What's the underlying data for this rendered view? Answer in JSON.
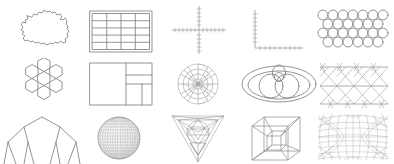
{
  "canvas": {
    "width": 394,
    "height": 164,
    "background": "#ffffff",
    "stroke_color": "#7a7a7a",
    "faint_stroke_color": "#a8a8a8"
  },
  "grid": {
    "columns": 5,
    "rows": 3,
    "cell_width": 79,
    "cell_height": 55
  },
  "figures": [
    {
      "id": "irregular-blob-contour",
      "name": "Irregular closed contour",
      "row": 1,
      "col": 1,
      "type": "outline",
      "description": "Jagged irregular closed polygon resembling a map region or amoeba outline",
      "x": 18,
      "y": 10,
      "w": 48,
      "h": 38
    },
    {
      "id": "rectangular-grid-table",
      "name": "Rectangular grid table",
      "row": 1,
      "col": 2,
      "type": "grid",
      "description": "Outer rectangle with inner 4 column by 5 row cell grid",
      "columns": 4,
      "rows": 5,
      "x": 91,
      "y": 12,
      "w": 60,
      "h": 40
    },
    {
      "id": "cross-axes-with-ticks",
      "name": "Cross axes with tick marks",
      "row": 1,
      "col": 3,
      "type": "axes",
      "description": "Horizontal and vertical axis crossing at origin, dashed tick marks along both",
      "tick_count_horizontal": 18,
      "tick_count_vertical": 14,
      "x": 172,
      "y": 8,
      "w": 52,
      "h": 46
    },
    {
      "id": "l-shaped-axes",
      "name": "L-shaped plot axes",
      "row": 1,
      "col": 4,
      "type": "axes",
      "description": "Left vertical axis and bottom horizontal axis forming an L with tick marks",
      "tick_count_horizontal": 10,
      "tick_count_vertical": 9,
      "x": 252,
      "y": 10,
      "w": 48,
      "h": 40
    },
    {
      "id": "hexagonal-circle-packing",
      "name": "Hexagonal circle packing",
      "row": 1,
      "col": 5,
      "type": "packing",
      "description": "Four offset rows of tangent circles in hexagonal close packing",
      "rows": 4,
      "circles_per_row": 6,
      "x": 318,
      "y": 10,
      "w": 72,
      "h": 40
    },
    {
      "id": "hexagon-flower-tiling",
      "name": "Hexagon flower cluster",
      "row": 2,
      "col": 1,
      "type": "tiling",
      "description": "Seven hexagons: one centre surrounded by six neighbours",
      "hexagon_count": 7,
      "x": 22,
      "y": 62,
      "w": 42,
      "h": 44
    },
    {
      "id": "treemap-layout",
      "name": "Treemap rectangle subdivision",
      "row": 2,
      "col": 2,
      "type": "treemap",
      "description": "Outer rectangle split into one large left block and a right column subdivided into four smaller blocks",
      "block_count": 5,
      "x": 90,
      "y": 63,
      "w": 62,
      "h": 42
    },
    {
      "id": "polar-radial-grid",
      "name": "Polar radial grid",
      "row": 2,
      "col": 3,
      "type": "polar",
      "description": "Concentric circles crossed by radial spokes forming a polar coordinate web",
      "ring_count": 4,
      "spoke_count": 12,
      "x": 176,
      "y": 62,
      "w": 44,
      "h": 44
    },
    {
      "id": "venn-ellipse-diagram",
      "name": "Venn ellipse diagram",
      "row": 2,
      "col": 4,
      "type": "venn",
      "description": "Large outer ellipse enclosing two overlapping circles with a small circle at the top intersection",
      "set_count": 3,
      "x": 243,
      "y": 64,
      "w": 72,
      "h": 38
    },
    {
      "id": "triangular-lattice-truss",
      "name": "Triangular lattice truss",
      "row": 2,
      "col": 5,
      "type": "lattice",
      "description": "Horizontal chords crossed by zig-zag diagonals forming a triangular truss mesh",
      "bay_count": 4,
      "course_count": 3,
      "x": 320,
      "y": 62,
      "w": 68,
      "h": 44
    },
    {
      "id": "branching-arch-tree",
      "name": "Branching arch tree",
      "row": 3,
      "col": 1,
      "type": "tree",
      "description": "Symmetric binary branching structure forming an arch with descending legs",
      "depth": 3,
      "x": 8,
      "y": 118,
      "w": 70,
      "h": 46
    },
    {
      "id": "wireframe-sphere",
      "name": "Wireframe sphere",
      "row": 3,
      "col": 2,
      "type": "sphere",
      "description": "Shaded sphere covered by a dense latitude and longitude wire mesh",
      "meridian_count": 24,
      "parallel_count": 16,
      "x": 96,
      "y": 118,
      "w": 44,
      "h": 44
    },
    {
      "id": "nested-triangle-tetrahedron",
      "name": "Nested triangle tetrahedron",
      "row": 3,
      "col": 3,
      "type": "polyhedron",
      "description": "Inverted triangle containing nested inscribed triangles and a hexagram core",
      "nesting_levels": 3,
      "x": 170,
      "y": 116,
      "w": 56,
      "h": 48
    },
    {
      "id": "tesseract-hypercube",
      "name": "Tesseract hypercube",
      "row": 3,
      "col": 4,
      "type": "polyhedron",
      "description": "Cube within a cube joined by corner edges, a projected four dimensional hypercube",
      "vertex_count": 16,
      "x": 250,
      "y": 118,
      "w": 52,
      "h": 46
    },
    {
      "id": "curved-projection-mesh",
      "name": "Curved projection mesh",
      "row": 3,
      "col": 5,
      "type": "mesh",
      "description": "Barrel distorted grid of curved meridians and parallels, a hyperbolic map projection net",
      "x": 318,
      "y": 116,
      "w": 72,
      "h": 48
    }
  ]
}
